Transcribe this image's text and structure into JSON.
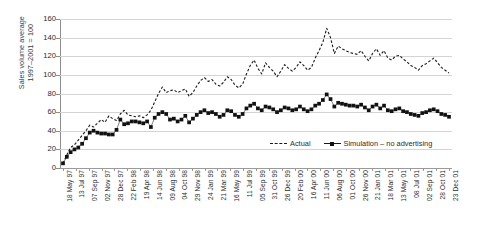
{
  "chart_data": {
    "type": "line",
    "title": "",
    "xlabel": "",
    "ylabel": "Sales volume average 1997–2001 = 100",
    "ylabel_lines": [
      "Sales volume average",
      "1997–2001 = 100"
    ],
    "ylim": [
      0,
      160
    ],
    "ytick_step": 20,
    "yticks": [
      0,
      20,
      40,
      60,
      80,
      100,
      120,
      140,
      160
    ],
    "grid": true,
    "grid_axis": "y",
    "legend_position": "inside-lower-right",
    "legend": [
      {
        "name": "Actual",
        "style": "dashed-line",
        "color": "#1a1a1a"
      },
      {
        "name": "Simulation – no advertising",
        "style": "line-with-square-markers",
        "color": "#111111"
      }
    ],
    "xtick_labels": [
      "18 May 97",
      "13 Jul 97",
      "07 Sep 97",
      "02 Nov 97",
      "28 Dec 97",
      "22 Feb 98",
      "19 Apr 98",
      "14 Jun 98",
      "09 Aug 98",
      "04 Oct 98",
      "29 Nov 98",
      "24 Jan 99",
      "21 Mar 99",
      "16 May 99",
      "11 Jul 99",
      "05 Sep 99",
      "31 Oct 99",
      "26 Dec 99",
      "20 Feb 00",
      "16 Apr 00",
      "11 Jun 00",
      "06 Aug 00",
      "01 Oct 00",
      "26 Nov 00",
      "21 Jan 01",
      "18 Mar 01",
      "13 May 01",
      "08 Jul 01",
      "02 Sep 01",
      "28 Oct 01",
      "23 Dec 01"
    ],
    "series": [
      {
        "name": "Actual",
        "values": [
          5,
          14,
          22,
          25,
          30,
          35,
          40,
          46,
          44,
          48,
          52,
          49,
          56,
          53,
          51,
          58,
          62,
          57,
          56,
          55,
          56,
          54,
          57,
          62,
          71,
          80,
          87,
          81,
          83,
          84,
          81,
          83,
          85,
          77,
          81,
          88,
          94,
          97,
          93,
          95,
          90,
          88,
          92,
          98,
          95,
          89,
          86,
          90,
          101,
          110,
          116,
          107,
          101,
          113,
          108,
          104,
          98,
          104,
          111,
          107,
          104,
          108,
          114,
          110,
          105,
          108,
          118,
          126,
          135,
          150,
          140,
          123,
          131,
          128,
          126,
          124,
          123,
          122,
          126,
          120,
          115,
          123,
          128,
          121,
          126,
          118,
          116,
          120,
          121,
          117,
          114,
          110,
          108,
          105,
          110,
          112,
          115,
          118,
          113,
          108,
          105,
          102
        ]
      },
      {
        "name": "Simulation – no advertising",
        "values": [
          5,
          12,
          17,
          20,
          22,
          26,
          32,
          38,
          40,
          38,
          37,
          37,
          36,
          36,
          41,
          52,
          47,
          48,
          50,
          50,
          49,
          48,
          50,
          44,
          54,
          58,
          60,
          58,
          52,
          53,
          50,
          52,
          56,
          49,
          53,
          57,
          60,
          62,
          59,
          60,
          58,
          55,
          57,
          62,
          61,
          57,
          55,
          58,
          64,
          67,
          69,
          64,
          62,
          66,
          65,
          63,
          60,
          62,
          65,
          64,
          62,
          63,
          66,
          63,
          61,
          63,
          67,
          69,
          73,
          79,
          74,
          66,
          70,
          69,
          68,
          67,
          67,
          66,
          68,
          65,
          62,
          66,
          68,
          64,
          67,
          62,
          61,
          63,
          64,
          61,
          60,
          58,
          57,
          56,
          59,
          60,
          62,
          63,
          61,
          58,
          57,
          55
        ]
      }
    ]
  }
}
